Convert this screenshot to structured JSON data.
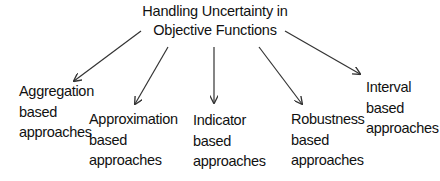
{
  "diagram": {
    "root": {
      "line1": "Handling Uncertainty in",
      "line2": "Objective Functions"
    },
    "children": [
      {
        "line1": "Aggregation",
        "line2": "based",
        "line3": "approaches"
      },
      {
        "line1": "Approximation",
        "line2": "based",
        "line3": "approaches"
      },
      {
        "line1": "Indicator",
        "line2": "based",
        "line3": "approaches"
      },
      {
        "line1": "Robustness",
        "line2": "based",
        "line3": "approaches"
      },
      {
        "line1": "Interval",
        "line2": "based",
        "line3": "approaches"
      }
    ],
    "edges": [
      {
        "from": "Handling Uncertainty in Objective Functions",
        "to": "Aggregation based approaches"
      },
      {
        "from": "Handling Uncertainty in Objective Functions",
        "to": "Approximation based approaches"
      },
      {
        "from": "Handling Uncertainty in Objective Functions",
        "to": "Indicator based approaches"
      },
      {
        "from": "Handling Uncertainty in Objective Functions",
        "to": "Robustness based approaches"
      },
      {
        "from": "Handling Uncertainty in Objective Functions",
        "to": "Interval based approaches"
      }
    ],
    "colors": {
      "text": "#111111",
      "arrow": "#333333",
      "background": "#ffffff"
    }
  }
}
